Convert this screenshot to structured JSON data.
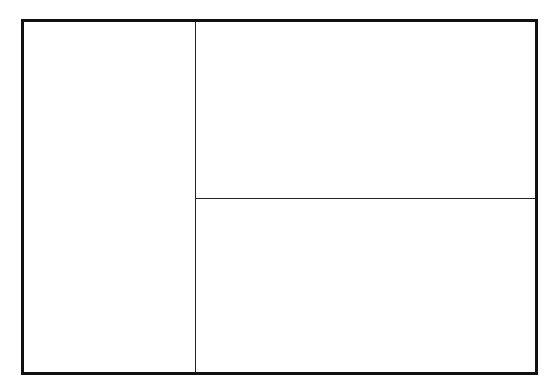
{
  "diagram": {
    "type": "layout-wireframe",
    "regions": [
      {
        "id": "left-panel",
        "label": ""
      },
      {
        "id": "top-right-panel",
        "label": ""
      },
      {
        "id": "bottom-right-panel",
        "label": ""
      }
    ],
    "colors": {
      "stroke": "#111111",
      "background": "#ffffff"
    }
  }
}
